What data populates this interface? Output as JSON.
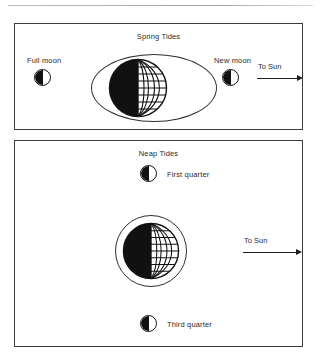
{
  "figure": {
    "kind": "tides-diagram",
    "line_color": "#2e2e2e",
    "fill_dark": "#111111"
  },
  "panels": [
    {
      "id": "spring",
      "title": "Spring Tides",
      "bulge_shape": "ellipse",
      "sun_direction_label": "To Sun",
      "moons": [
        {
          "name": "full-moon",
          "label": "Full moon",
          "phase": "half-dark-left"
        },
        {
          "name": "new-moon",
          "label": "New moon",
          "phase": "half-dark-left"
        }
      ]
    },
    {
      "id": "neap",
      "title": "Neap Tides",
      "bulge_shape": "circle",
      "sun_direction_label": "To Sun",
      "moons": [
        {
          "name": "first-quarter-moon",
          "label": "First quarter",
          "phase": "half-dark-left"
        },
        {
          "name": "third-quarter-moon",
          "label": "Third quarter",
          "phase": "half-dark-left"
        }
      ]
    }
  ],
  "labels": {
    "spring_title": "Spring Tides",
    "neap_title": "Neap Tides",
    "full_moon": "Full moon",
    "new_moon": "New moon",
    "first_quarter": "First quarter",
    "third_quarter": "Third quarter",
    "to_sun_spring": "To Sun",
    "to_sun_neap": "To Sun"
  }
}
